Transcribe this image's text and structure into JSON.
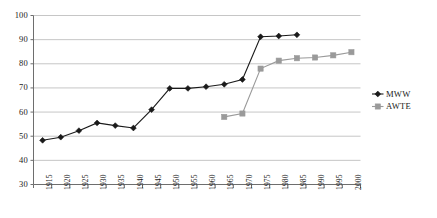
{
  "chart_data": {
    "type": "line",
    "title": "",
    "xlabel": "",
    "ylabel": "",
    "ylim": [
      30,
      100
    ],
    "ytick_step": 10,
    "yticks": [
      30,
      40,
      50,
      60,
      70,
      80,
      90,
      100
    ],
    "grid": true,
    "grid_axis": "y",
    "legend_position": "right",
    "categories": [
      "1915",
      "1920",
      "1925",
      "1930",
      "1935",
      "1940",
      "1945",
      "1950",
      "1955",
      "1960",
      "1965",
      "1970",
      "1975",
      "1980",
      "1985",
      "1990",
      "1995",
      "2000"
    ],
    "series": [
      {
        "name": "MWW",
        "marker": "diamond",
        "color": "#1a1a1a",
        "values": [
          48.3,
          49.6,
          52.3,
          55.5,
          54.4,
          53.4,
          61.0,
          69.8,
          69.8,
          70.5,
          71.5,
          73.5,
          91.2,
          91.5,
          92.0,
          null,
          null,
          null
        ]
      },
      {
        "name": "AWTE",
        "marker": "square",
        "color": "#9a9a9a",
        "values": [
          null,
          null,
          null,
          null,
          null,
          null,
          null,
          null,
          null,
          null,
          58.0,
          59.4,
          78.0,
          81.3,
          82.3,
          82.6,
          83.5,
          84.8
        ]
      }
    ]
  },
  "legend": {
    "entries": [
      {
        "label": "MWW"
      },
      {
        "label": "AWTE"
      }
    ]
  },
  "colors": {
    "series_mww": "#1a1a1a",
    "series_awte": "#9a9a9a",
    "gridline": "#b7b7b7",
    "axis": "#6e6e6e",
    "background": "#ffffff"
  }
}
